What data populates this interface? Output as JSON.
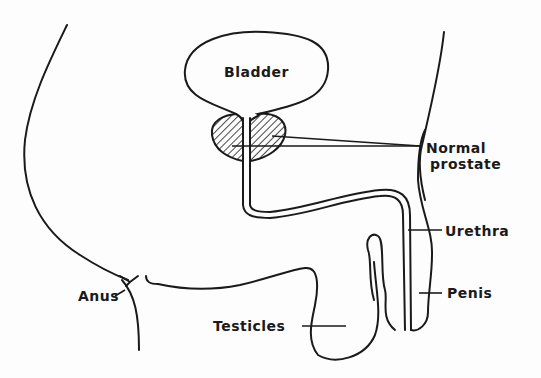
{
  "diagram": {
    "labels": {
      "bladder": "Bladder",
      "prostate_line1": "Normal",
      "prostate_line2": "prostate",
      "urethra": "Urethra",
      "penis": "Penis",
      "anus": "Anus",
      "testicles": "Testicles"
    },
    "colors": {
      "stroke": "#1a1a1a",
      "background": "#fdfdfd"
    }
  }
}
